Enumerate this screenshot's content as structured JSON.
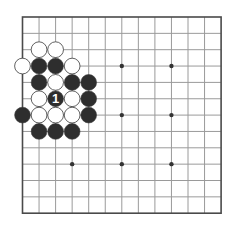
{
  "board": {
    "size": 13,
    "origin_x": 22.5,
    "origin_y": 17,
    "spacing_x": 16.55,
    "spacing_y": 16.35,
    "line_color": "#9a9a9a",
    "border_color": "#4a4a4a",
    "star_points": [
      [
        3,
        3
      ],
      [
        9,
        3
      ],
      [
        6,
        6
      ],
      [
        3,
        9
      ],
      [
        6,
        9
      ],
      [
        9,
        9
      ],
      [
        9,
        6
      ]
    ],
    "visible_star_points": [
      [
        6,
        3
      ],
      [
        9,
        3
      ],
      [
        6,
        6
      ],
      [
        9,
        6
      ],
      [
        3,
        9
      ],
      [
        6,
        9
      ],
      [
        9,
        9
      ]
    ]
  },
  "colors": {
    "black_stone": "#2e2e2e",
    "white_stone": "#ffffff",
    "stone_outline": "#3a3a3a",
    "label_on_black": "#ffffff"
  },
  "stones": [
    {
      "color": "white",
      "col": 1,
      "row": 2
    },
    {
      "color": "white",
      "col": 2,
      "row": 2
    },
    {
      "color": "white",
      "col": 0,
      "row": 3
    },
    {
      "color": "black",
      "col": 1,
      "row": 3
    },
    {
      "color": "black",
      "col": 2,
      "row": 3
    },
    {
      "color": "white",
      "col": 3,
      "row": 3
    },
    {
      "color": "black",
      "col": 1,
      "row": 4
    },
    {
      "color": "white",
      "col": 2,
      "row": 4
    },
    {
      "color": "black",
      "col": 3,
      "row": 4
    },
    {
      "color": "black",
      "col": 4,
      "row": 4
    },
    {
      "color": "white",
      "col": 1,
      "row": 5
    },
    {
      "color": "black",
      "col": 2,
      "row": 5,
      "label": "1"
    },
    {
      "color": "white",
      "col": 3,
      "row": 5
    },
    {
      "color": "black",
      "col": 4,
      "row": 5
    },
    {
      "color": "black",
      "col": 0,
      "row": 6
    },
    {
      "color": "white",
      "col": 1,
      "row": 6
    },
    {
      "color": "white",
      "col": 2,
      "row": 6
    },
    {
      "color": "white",
      "col": 3,
      "row": 6
    },
    {
      "color": "black",
      "col": 4,
      "row": 6
    },
    {
      "color": "black",
      "col": 1,
      "row": 7
    },
    {
      "color": "black",
      "col": 2,
      "row": 7
    },
    {
      "color": "black",
      "col": 3,
      "row": 7
    }
  ]
}
